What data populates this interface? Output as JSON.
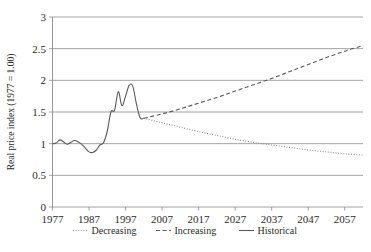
{
  "chart_data": {
    "type": "line",
    "title": "",
    "xlabel": "",
    "ylabel": "Real price index (1977 = 1.00)",
    "xlim": [
      1977,
      2062
    ],
    "ylim": [
      0,
      3
    ],
    "xticks": [
      "1977",
      "1987",
      "1997",
      "2007",
      "2017",
      "2027",
      "2037",
      "2047",
      "2057"
    ],
    "xtick_values": [
      1977,
      1987,
      1997,
      2007,
      2017,
      2027,
      2037,
      2047,
      2057
    ],
    "yticks": [
      "0",
      "0.5",
      "1",
      "1.5",
      "2",
      "2.5",
      "3"
    ],
    "ytick_values": [
      0,
      0.5,
      1,
      1.5,
      2,
      2.5,
      3
    ],
    "grid": "horizontal",
    "legend_position": "bottom",
    "legend": [
      {
        "name": "Decreasing",
        "style": "dotted",
        "color": "#8f8f8f"
      },
      {
        "name": "Increasing",
        "style": "dashed",
        "color": "#5a5a5a"
      },
      {
        "name": "Historical",
        "style": "solid",
        "color": "#5a5a5a"
      }
    ],
    "series": [
      {
        "name": "Historical",
        "style": "solid",
        "x": [
          1977,
          1978,
          1979,
          1980,
          1981,
          1982,
          1983,
          1984,
          1985,
          1986,
          1987,
          1988,
          1989,
          1990,
          1991,
          1992,
          1993,
          1994,
          1995,
          1996,
          1997,
          1998,
          1999,
          2000,
          2001,
          2002
        ],
        "values": [
          1.0,
          1.01,
          1.06,
          1.03,
          0.99,
          1.02,
          1.05,
          1.03,
          0.99,
          0.93,
          0.87,
          0.86,
          0.9,
          0.98,
          1.02,
          1.2,
          1.5,
          1.53,
          1.82,
          1.6,
          1.75,
          1.92,
          1.9,
          1.62,
          1.41,
          1.4
        ]
      },
      {
        "name": "Increasing",
        "style": "dashed",
        "x": [
          2002,
          2007,
          2012,
          2017,
          2022,
          2027,
          2032,
          2037,
          2042,
          2047,
          2052,
          2057,
          2062
        ],
        "values": [
          1.4,
          1.47,
          1.55,
          1.64,
          1.73,
          1.83,
          1.93,
          2.03,
          2.14,
          2.25,
          2.36,
          2.46,
          2.55
        ]
      },
      {
        "name": "Decreasing",
        "style": "dotted",
        "x": [
          2002,
          2007,
          2012,
          2017,
          2022,
          2027,
          2032,
          2037,
          2042,
          2047,
          2052,
          2057,
          2062
        ],
        "values": [
          1.4,
          1.33,
          1.26,
          1.19,
          1.13,
          1.07,
          1.02,
          0.98,
          0.94,
          0.9,
          0.87,
          0.84,
          0.82
        ]
      }
    ]
  }
}
